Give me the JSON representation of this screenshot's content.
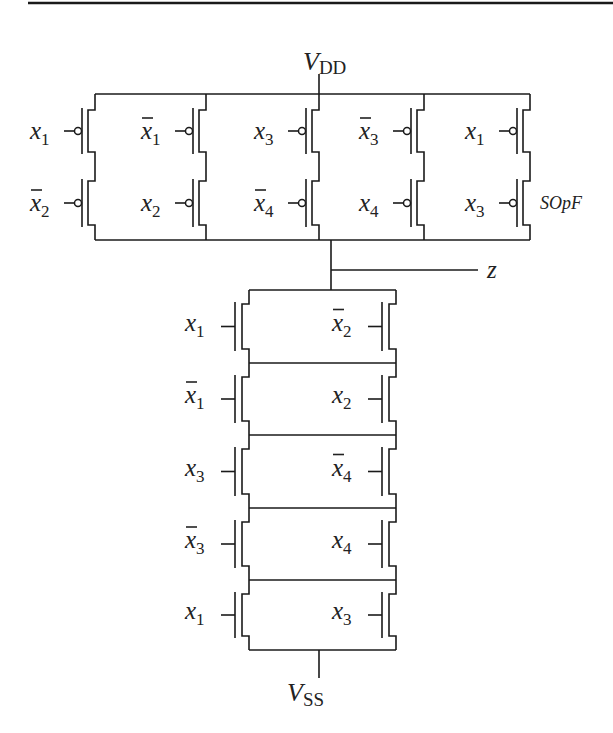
{
  "diagram": {
    "colors": {
      "ink": "#1a1a1a",
      "background": "#ffffff"
    },
    "supply_top": {
      "name": "V",
      "sub": "DD"
    },
    "supply_bottom": {
      "name": "V",
      "sub": "SS"
    },
    "output": {
      "label": "z"
    },
    "pullup_annotation": "SOpF",
    "pullup_network": {
      "type": "PMOS",
      "topology": "5 parallel branches, each 2 series PMOS",
      "branches": [
        {
          "top": {
            "var": "x",
            "sub": "1",
            "bar": false
          },
          "bottom": {
            "var": "x",
            "sub": "2",
            "bar": true
          }
        },
        {
          "top": {
            "var": "x",
            "sub": "1",
            "bar": true
          },
          "bottom": {
            "var": "x",
            "sub": "2",
            "bar": false
          }
        },
        {
          "top": {
            "var": "x",
            "sub": "3",
            "bar": false
          },
          "bottom": {
            "var": "x",
            "sub": "4",
            "bar": true
          }
        },
        {
          "top": {
            "var": "x",
            "sub": "3",
            "bar": true
          },
          "bottom": {
            "var": "x",
            "sub": "4",
            "bar": false
          }
        },
        {
          "top": {
            "var": "x",
            "sub": "1",
            "bar": false
          },
          "bottom": {
            "var": "x",
            "sub": "3",
            "bar": false
          }
        }
      ]
    },
    "pulldown_network": {
      "type": "NMOS",
      "topology": "5 series stages, each 2 parallel NMOS",
      "stages": [
        {
          "left": {
            "var": "x",
            "sub": "1",
            "bar": false
          },
          "right": {
            "var": "x",
            "sub": "2",
            "bar": true
          }
        },
        {
          "left": {
            "var": "x",
            "sub": "1",
            "bar": true
          },
          "right": {
            "var": "x",
            "sub": "2",
            "bar": false
          }
        },
        {
          "left": {
            "var": "x",
            "sub": "3",
            "bar": false
          },
          "right": {
            "var": "x",
            "sub": "4",
            "bar": true
          }
        },
        {
          "left": {
            "var": "x",
            "sub": "3",
            "bar": true
          },
          "right": {
            "var": "x",
            "sub": "4",
            "bar": false
          }
        },
        {
          "left": {
            "var": "x",
            "sub": "1",
            "bar": false
          },
          "right": {
            "var": "x",
            "sub": "3",
            "bar": false
          }
        }
      ]
    }
  }
}
